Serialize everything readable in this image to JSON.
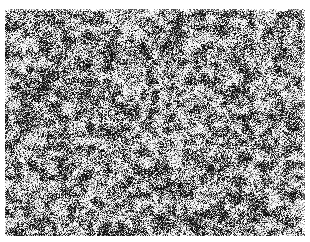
{
  "image": {
    "kind": "grayscale-noise-texture",
    "description": "Dense black-and-white speckle / grain noise pattern",
    "background_color": "#ffffff",
    "colors": {
      "dark": "#111111",
      "light": "#f4f4f4"
    },
    "region": {
      "x": 5,
      "y": 9,
      "width": 300,
      "height": 227
    },
    "seed": 1337,
    "grain_px": 1.5,
    "dark_ratio": 0.48
  }
}
